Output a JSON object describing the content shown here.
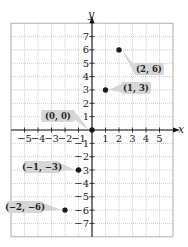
{
  "chart_data": {
    "type": "scatter",
    "title": "",
    "xlabel": "x",
    "ylabel": "y",
    "xlim": [
      -6,
      6
    ],
    "ylim": [
      -8,
      8
    ],
    "grid": true,
    "x_ticks": [
      -5,
      -4,
      -3,
      -2,
      -1,
      1,
      2,
      3,
      4,
      5
    ],
    "y_ticks": [
      7,
      6,
      5,
      4,
      3,
      2,
      1,
      -1,
      -2,
      -3,
      -4,
      -5,
      -6,
      -7
    ],
    "x_tick_labels": [
      "−5",
      "−4",
      "−3",
      "−2",
      "−1",
      "1",
      "2",
      "3",
      "4",
      "5"
    ],
    "y_tick_labels": [
      "7",
      "6",
      "5",
      "4",
      "3",
      "2",
      "1",
      "−1",
      "−2",
      "−3",
      "−4",
      "−5",
      "−6",
      "−7"
    ],
    "series": [
      {
        "name": "points",
        "points": [
          {
            "x": 2,
            "y": 6,
            "label": "(2, 6)"
          },
          {
            "x": 1,
            "y": 3,
            "label": "(1, 3)"
          },
          {
            "x": 0,
            "y": 0,
            "label": "(0, 0)"
          },
          {
            "x": -1,
            "y": -3,
            "label": "(−1, −3)"
          },
          {
            "x": -2,
            "y": -6,
            "label": "(−2, −6)"
          }
        ]
      }
    ]
  },
  "colors": {
    "grid": "#b9b9b9",
    "axis": "#111111",
    "point": "#1a1a1a",
    "callout": "#d6d6d6"
  }
}
